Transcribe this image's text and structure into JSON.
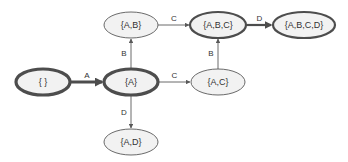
{
  "diagram": {
    "type": "state-lattice",
    "colors": {
      "stroke": "#595959",
      "fill": "#f2f2f2",
      "thick_stroke": "#4d4d4d",
      "text": "#333333"
    },
    "nodes": [
      {
        "id": "empty",
        "label": "{ }",
        "emphasis": "bold"
      },
      {
        "id": "A",
        "label": "{A}",
        "emphasis": "bold"
      },
      {
        "id": "AB",
        "label": "{A,B}",
        "emphasis": "normal"
      },
      {
        "id": "ABC",
        "label": "{A,B,C}",
        "emphasis": "medium"
      },
      {
        "id": "ABCD",
        "label": "{A,B,C,D}",
        "emphasis": "medium"
      },
      {
        "id": "AC",
        "label": "{A,C}",
        "emphasis": "normal"
      },
      {
        "id": "AD",
        "label": "{A,D}",
        "emphasis": "normal"
      }
    ],
    "edges": [
      {
        "from": "empty",
        "to": "A",
        "label": "A",
        "emphasis": "bold"
      },
      {
        "from": "A",
        "to": "AB",
        "label": "B",
        "emphasis": "normal"
      },
      {
        "from": "A",
        "to": "AC",
        "label": "C",
        "emphasis": "normal"
      },
      {
        "from": "A",
        "to": "AD",
        "label": "D",
        "emphasis": "normal"
      },
      {
        "from": "AB",
        "to": "ABC",
        "label": "C",
        "emphasis": "normal"
      },
      {
        "from": "AC",
        "to": "ABC",
        "label": "B",
        "emphasis": "normal"
      },
      {
        "from": "ABC",
        "to": "ABCD",
        "label": "D",
        "emphasis": "medium"
      }
    ]
  }
}
